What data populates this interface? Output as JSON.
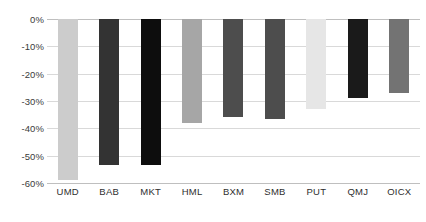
{
  "chart_data": {
    "type": "bar",
    "title": "",
    "subtitle": "",
    "xlabel": "",
    "ylabel": "",
    "categories": [
      "UMD",
      "BAB",
      "MKT",
      "HML",
      "BXM",
      "SMB",
      "PUT",
      "QMJ",
      "OICX"
    ],
    "values": [
      -59,
      -53.5,
      -53.5,
      -38,
      -36,
      -36.5,
      -33,
      -29,
      -27
    ],
    "bar_colors": [
      "#cccccc",
      "#333333",
      "#0d0d0d",
      "#a6a6a6",
      "#4d4d4d",
      "#4d4d4d",
      "#e6e6e6",
      "#1a1a1a",
      "#737373"
    ],
    "ylim": [
      -60,
      0
    ],
    "yticks": [
      0,
      -10,
      -20,
      -30,
      -40,
      -50,
      -60
    ],
    "ytick_labels": [
      "0%",
      "-10%",
      "-20%",
      "-30%",
      "-40%",
      "-50%",
      "-60%"
    ],
    "grid": true,
    "legend": "none",
    "gridline_color": "#d9d9d9",
    "axis_color": "#bfbfbf",
    "background": "#ffffff"
  }
}
